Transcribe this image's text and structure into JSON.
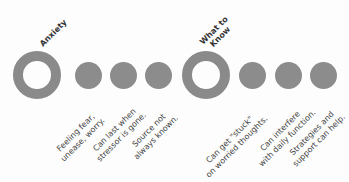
{
  "groups": [
    {
      "title": "Anxiety",
      "items": [
        {
          "line1": "Feeling fear,",
          "line2": "unease, worry."
        },
        {
          "line1": "Can last when",
          "line2": "stressor is gone."
        },
        {
          "line1": "Source not",
          "line2": "always known."
        }
      ]
    },
    {
      "title_line1": "What to",
      "title_line2": "Know",
      "items": [
        {
          "line1": "Can get \"stuck\"",
          "line2": "on worried thoughts."
        },
        {
          "line1": "Can interfere",
          "line2": "with daily function."
        },
        {
          "line1": "Strategies and",
          "line2": "support can help."
        }
      ]
    }
  ],
  "colors": {
    "circle": "#8a8a8a",
    "background": "#fdfdfd",
    "text": "#3a3a3a"
  }
}
